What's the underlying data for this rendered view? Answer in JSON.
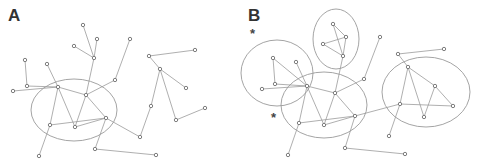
{
  "figure": {
    "panels": [
      {
        "label": "A",
        "nodes": [
          [
            83,
            25
          ],
          [
            97,
            39
          ],
          [
            74,
            46
          ],
          [
            94,
            58
          ],
          [
            130,
            39
          ],
          [
            25,
            60
          ],
          [
            47,
            64
          ],
          [
            27,
            86
          ],
          [
            13,
            91
          ],
          [
            58,
            87
          ],
          [
            86,
            95
          ],
          [
            115,
            80
          ],
          [
            106,
            118
          ],
          [
            50,
            125
          ],
          [
            75,
            127
          ],
          [
            95,
            149
          ],
          [
            39,
            156
          ],
          [
            156,
            155
          ],
          [
            140,
            137
          ],
          [
            149,
            56
          ],
          [
            160,
            69
          ],
          [
            186,
            88
          ],
          [
            205,
            108
          ],
          [
            176,
            120
          ],
          [
            151,
            106
          ],
          [
            195,
            50
          ]
        ],
        "edges": [
          [
            0,
            3
          ],
          [
            1,
            3
          ],
          [
            2,
            3
          ],
          [
            3,
            10
          ],
          [
            4,
            11
          ],
          [
            11,
            10
          ],
          [
            5,
            7
          ],
          [
            6,
            9
          ],
          [
            7,
            9
          ],
          [
            8,
            9
          ],
          [
            9,
            10
          ],
          [
            9,
            14
          ],
          [
            9,
            13
          ],
          [
            10,
            14
          ],
          [
            10,
            12
          ],
          [
            13,
            12
          ],
          [
            14,
            12
          ],
          [
            13,
            16
          ],
          [
            12,
            15
          ],
          [
            15,
            17
          ],
          [
            12,
            18
          ],
          [
            19,
            25
          ],
          [
            19,
            20
          ],
          [
            20,
            21
          ],
          [
            20,
            24
          ],
          [
            20,
            23
          ],
          [
            23,
            22
          ],
          [
            24,
            18
          ]
        ],
        "ellipses": [
          {
            "cx": 74,
            "cy": 110,
            "rx": 43,
            "ry": 31
          }
        ],
        "stars": []
      },
      {
        "label": "B",
        "nodes": [
          [
            93,
            24
          ],
          [
            106,
            37
          ],
          [
            83,
            44
          ],
          [
            103,
            56
          ],
          [
            140,
            37
          ],
          [
            33,
            58
          ],
          [
            56,
            62
          ],
          [
            35,
            84
          ],
          [
            22,
            89
          ],
          [
            67,
            86
          ],
          [
            95,
            93
          ],
          [
            124,
            79
          ],
          [
            115,
            116
          ],
          [
            59,
            123
          ],
          [
            84,
            125
          ],
          [
            105,
            148
          ],
          [
            48,
            155
          ],
          [
            165,
            154
          ],
          [
            149,
            136
          ],
          [
            158,
            54
          ],
          [
            168,
            67
          ],
          [
            195,
            86
          ],
          [
            213,
            106
          ],
          [
            184,
            117
          ],
          [
            160,
            104
          ],
          [
            204,
            49
          ]
        ],
        "edges": [
          [
            0,
            3
          ],
          [
            1,
            3
          ],
          [
            2,
            3
          ],
          [
            0,
            1
          ],
          [
            1,
            2
          ],
          [
            3,
            10
          ],
          [
            4,
            11
          ],
          [
            11,
            10
          ],
          [
            5,
            7
          ],
          [
            6,
            9
          ],
          [
            7,
            9
          ],
          [
            8,
            9
          ],
          [
            5,
            9
          ],
          [
            9,
            10
          ],
          [
            9,
            14
          ],
          [
            9,
            13
          ],
          [
            10,
            14
          ],
          [
            10,
            12
          ],
          [
            13,
            12
          ],
          [
            14,
            12
          ],
          [
            13,
            16
          ],
          [
            12,
            15
          ],
          [
            15,
            17
          ],
          [
            12,
            24
          ],
          [
            19,
            25
          ],
          [
            19,
            20
          ],
          [
            20,
            21
          ],
          [
            20,
            24
          ],
          [
            20,
            23
          ],
          [
            23,
            21
          ],
          [
            24,
            22
          ],
          [
            21,
            22
          ],
          [
            24,
            18
          ]
        ],
        "ellipses": [
          {
            "cx": 37,
            "cy": 73,
            "rx": 36,
            "ry": 33
          },
          {
            "cx": 96,
            "cy": 39,
            "rx": 23,
            "ry": 30
          },
          {
            "cx": 84,
            "cy": 105,
            "rx": 43,
            "ry": 33
          },
          {
            "cx": 186,
            "cy": 92,
            "rx": 44,
            "ry": 35
          }
        ],
        "stars": [
          {
            "x": 14,
            "y": 33,
            "text": "*"
          },
          {
            "x": 35,
            "y": 117,
            "text": "*"
          }
        ]
      }
    ],
    "colors": {
      "edge": "#9a9a9a",
      "ellipse": "#9a9a9a",
      "node_stroke": "#6f6f6f",
      "label": "#333333"
    }
  }
}
